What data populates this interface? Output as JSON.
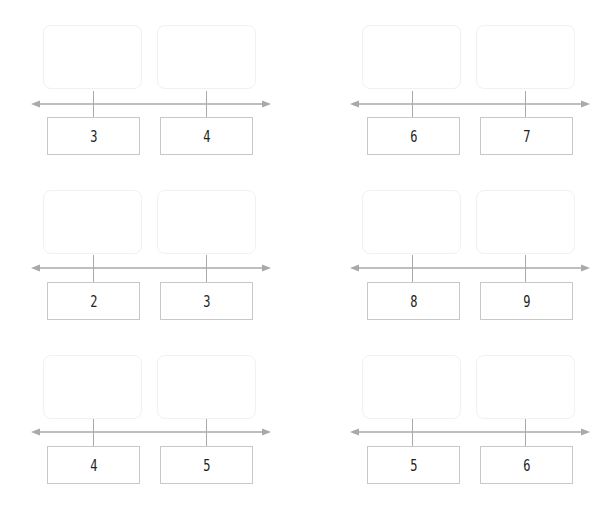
{
  "colors": {
    "axis": "#a9a9a9",
    "number_box_border": "#c8c8c8",
    "answer_box_border": "#f1f1f1",
    "digit": "#222222"
  },
  "groups": [
    {
      "position": "row1-left",
      "numbers": [
        "3",
        "4"
      ],
      "answers": [
        "",
        ""
      ]
    },
    {
      "position": "row1-right",
      "numbers": [
        "6",
        "7"
      ],
      "answers": [
        "",
        ""
      ]
    },
    {
      "position": "row2-left",
      "numbers": [
        "2",
        "3"
      ],
      "answers": [
        "",
        ""
      ]
    },
    {
      "position": "row2-right",
      "numbers": [
        "8",
        "9"
      ],
      "answers": [
        "",
        ""
      ]
    },
    {
      "position": "row3-left",
      "numbers": [
        "4",
        "5"
      ],
      "answers": [
        "",
        ""
      ]
    },
    {
      "position": "row3-right",
      "numbers": [
        "5",
        "6"
      ],
      "answers": [
        "",
        ""
      ]
    }
  ]
}
